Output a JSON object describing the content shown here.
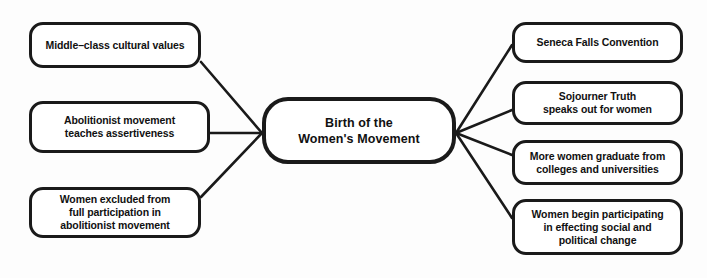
{
  "diagram": {
    "type": "concept-map",
    "title": "Birth of the Women's Movement",
    "background_color": "#fdfdfd",
    "stroke_color": "#1a1a1a",
    "node_fill_color": "#ffffff",
    "center": {
      "label": "Birth of the\nWomen's Movement",
      "x": 262,
      "y": 97,
      "width": 194,
      "height": 67
    },
    "causes": [
      {
        "label": "Middle–class cultural values",
        "x": 29,
        "y": 22,
        "width": 172,
        "height": 46
      },
      {
        "label": "Abolitionist movement\nteaches assertiveness",
        "x": 29,
        "y": 101,
        "width": 181,
        "height": 52
      },
      {
        "label": "Women excluded from\nfull participation in\nabolitionist movement",
        "x": 29,
        "y": 187,
        "width": 172,
        "height": 51
      }
    ],
    "effects": [
      {
        "label": "Seneca Falls Convention",
        "x": 512,
        "y": 22,
        "width": 171,
        "height": 41
      },
      {
        "label": "Sojourner Truth\nspeaks out for women",
        "x": 512,
        "y": 81,
        "width": 171,
        "height": 44
      },
      {
        "label": "More women graduate from\ncolleges and universities",
        "x": 512,
        "y": 140,
        "width": 171,
        "height": 45
      },
      {
        "label": "Women begin participating\nin effecting social and\npolitical change",
        "x": 512,
        "y": 199,
        "width": 171,
        "height": 56
      }
    ],
    "connectors": {
      "left_junction": {
        "x": 262,
        "y": 133
      },
      "right_junction": {
        "x": 456,
        "y": 133
      },
      "edges": [
        {
          "from": "cause-0",
          "to": "center",
          "x1": 201,
          "y1": 62,
          "x2": 262,
          "y2": 133
        },
        {
          "from": "cause-1",
          "to": "center",
          "x1": 210,
          "y1": 133,
          "x2": 262,
          "y2": 133
        },
        {
          "from": "cause-2",
          "to": "center",
          "x1": 201,
          "y1": 197,
          "x2": 262,
          "y2": 133
        },
        {
          "from": "center",
          "to": "effect-0",
          "x1": 456,
          "y1": 133,
          "x2": 512,
          "y2": 45
        },
        {
          "from": "center",
          "to": "effect-1",
          "x1": 456,
          "y1": 133,
          "x2": 512,
          "y2": 110
        },
        {
          "from": "center",
          "to": "effect-2",
          "x1": 456,
          "y1": 133,
          "x2": 512,
          "y2": 155
        },
        {
          "from": "center",
          "to": "effect-3",
          "x1": 456,
          "y1": 133,
          "x2": 512,
          "y2": 218
        }
      ]
    }
  }
}
